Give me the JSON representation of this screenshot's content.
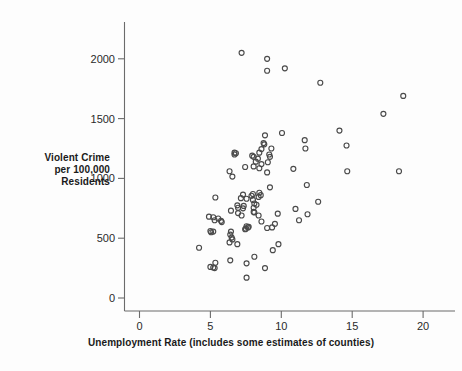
{
  "chart_data": {
    "type": "scatter",
    "title": "",
    "xlabel": "Unemployment Rate (includes some estimates of counties)",
    "ylabel": "Violent Crime per 100,000 Residents",
    "ylabel_lines": [
      "Violent Crime",
      "per 100,000",
      "Residents"
    ],
    "xlim": [
      0,
      21.5
    ],
    "ylim": [
      0,
      2200
    ],
    "xticks": [
      0,
      5,
      10,
      15,
      20
    ],
    "xtick_labels": [
      "0",
      "5",
      "10",
      "15",
      "20"
    ],
    "yticks": [
      0,
      500,
      1000,
      1500,
      2000
    ],
    "ytick_labels": [
      "0",
      "500",
      "1000",
      "1500",
      "2000"
    ],
    "grid": false,
    "legend": null,
    "marker": "open-circle",
    "marker_color": "#4a4a4a",
    "n_points": 104,
    "points": [
      [
        7.2,
        2050
      ],
      [
        9.0,
        2000
      ],
      [
        9.0,
        1900
      ],
      [
        10.25,
        1920
      ],
      [
        12.75,
        1800
      ],
      [
        18.6,
        1690
      ],
      [
        17.2,
        1540
      ],
      [
        14.1,
        1400
      ],
      [
        10.05,
        1380
      ],
      [
        8.85,
        1360
      ],
      [
        11.65,
        1320
      ],
      [
        14.6,
        1275
      ],
      [
        8.75,
        1295
      ],
      [
        8.8,
        1285
      ],
      [
        9.3,
        1250
      ],
      [
        11.7,
        1250
      ],
      [
        8.6,
        1245
      ],
      [
        8.45,
        1215
      ],
      [
        9.15,
        1200
      ],
      [
        9.2,
        1180
      ],
      [
        6.7,
        1215
      ],
      [
        6.8,
        1210
      ],
      [
        6.7,
        1200
      ],
      [
        7.95,
        1190
      ],
      [
        8.05,
        1180
      ],
      [
        8.35,
        1165
      ],
      [
        8.2,
        1140
      ],
      [
        9.05,
        1135
      ],
      [
        8.6,
        1120
      ],
      [
        8.05,
        1100
      ],
      [
        7.45,
        1095
      ],
      [
        8.45,
        1085
      ],
      [
        10.85,
        1080
      ],
      [
        6.35,
        1060
      ],
      [
        14.65,
        1060
      ],
      [
        18.3,
        1060
      ],
      [
        9.0,
        1050
      ],
      [
        6.55,
        1015
      ],
      [
        11.8,
        945
      ],
      [
        9.2,
        925
      ],
      [
        8.45,
        880
      ],
      [
        8.0,
        870
      ],
      [
        7.3,
        865
      ],
      [
        8.55,
        860
      ],
      [
        8.4,
        845
      ],
      [
        5.35,
        840
      ],
      [
        7.15,
        835
      ],
      [
        7.55,
        830
      ],
      [
        8.0,
        820
      ],
      [
        12.6,
        805
      ],
      [
        8.1,
        790
      ],
      [
        8.25,
        780
      ],
      [
        6.9,
        775
      ],
      [
        7.35,
        770
      ],
      [
        8.05,
        755
      ],
      [
        7.3,
        750
      ],
      [
        11.0,
        745
      ],
      [
        6.45,
        730
      ],
      [
        8.05,
        720
      ],
      [
        8.1,
        715
      ],
      [
        6.95,
        710
      ],
      [
        9.75,
        705
      ],
      [
        11.85,
        700
      ],
      [
        8.4,
        690
      ],
      [
        7.2,
        690
      ],
      [
        4.9,
        680
      ],
      [
        5.2,
        675
      ],
      [
        5.55,
        665
      ],
      [
        5.3,
        650
      ],
      [
        11.25,
        650
      ],
      [
        5.75,
        645
      ],
      [
        5.8,
        635
      ],
      [
        9.55,
        620
      ],
      [
        7.55,
        600
      ],
      [
        7.7,
        595
      ],
      [
        7.65,
        590
      ],
      [
        9.35,
        590
      ],
      [
        9.0,
        585
      ],
      [
        7.5,
        580
      ],
      [
        7.45,
        575
      ],
      [
        5.0,
        560
      ],
      [
        5.2,
        555
      ],
      [
        5.05,
        550
      ],
      [
        6.45,
        555
      ],
      [
        6.4,
        530
      ],
      [
        6.5,
        505
      ],
      [
        6.55,
        490
      ],
      [
        6.35,
        465
      ],
      [
        9.8,
        450
      ],
      [
        6.9,
        450
      ],
      [
        9.4,
        400
      ],
      [
        4.2,
        420
      ],
      [
        8.1,
        345
      ],
      [
        6.4,
        315
      ],
      [
        7.55,
        290
      ],
      [
        5.35,
        295
      ],
      [
        5.0,
        260
      ],
      [
        5.2,
        255
      ],
      [
        5.3,
        250
      ],
      [
        8.85,
        250
      ],
      [
        7.55,
        170
      ],
      [
        8.6,
        640
      ],
      [
        7.9,
        855
      ],
      [
        6.95,
        755
      ]
    ]
  }
}
